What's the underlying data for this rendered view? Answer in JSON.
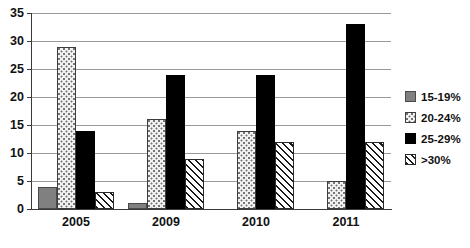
{
  "chart_data": {
    "type": "bar",
    "title": "",
    "subtitle": "",
    "xlabel": "",
    "ylabel": "",
    "categories": [
      "2005",
      "2009",
      "2010",
      "2011"
    ],
    "series": [
      {
        "name": "15-19%",
        "values": [
          4,
          1,
          0,
          0
        ],
        "fill": "solid-gray",
        "color": "#808080"
      },
      {
        "name": "20-24%",
        "values": [
          29,
          16,
          14,
          5
        ],
        "fill": "dotted-light",
        "color": "#f2f2f2"
      },
      {
        "name": "25-29%",
        "values": [
          14,
          24,
          24,
          33
        ],
        "fill": "solid-black",
        "color": "#000000"
      },
      {
        "name": ">30%",
        "values": [
          3,
          9,
          12,
          12
        ],
        "fill": "diagonal-hatch",
        "color": "#ffffff"
      }
    ],
    "ylim": [
      0,
      35
    ],
    "yticks": [
      0,
      5,
      10,
      15,
      20,
      25,
      30,
      35
    ],
    "ytick_labels": [
      "0",
      "5",
      "10",
      "15",
      "20",
      "25",
      "30",
      "35"
    ],
    "grid": true,
    "grid_axis": "y",
    "legend_position": "right",
    "gridline_color": "#9a9a9a",
    "axis_color": "#3a3a3a",
    "background": "#ffffff"
  },
  "legend": {
    "items": [
      {
        "label": "15-19%",
        "swatch_name": "legend-swatch-15-19"
      },
      {
        "label": "20-24%",
        "swatch_name": "legend-swatch-20-24"
      },
      {
        "label": "25-29%",
        "swatch_name": "legend-swatch-25-29"
      },
      {
        "label": ">30%",
        "swatch_name": "legend-swatch-over-30"
      }
    ]
  }
}
